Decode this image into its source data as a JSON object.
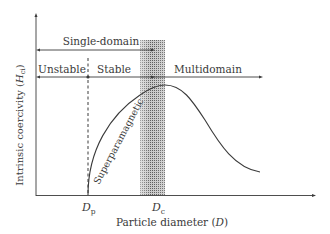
{
  "diagram": {
    "type": "coercivity-vs-particle-diameter",
    "y_axis_label": "Intrinsic coercivity (",
    "y_axis_symbol": "H",
    "y_axis_subscript": "ci",
    "y_axis_close": ")",
    "x_axis_label": "Particle diameter (",
    "x_axis_symbol": "D",
    "x_axis_close": ")",
    "tick_dp_main": "D",
    "tick_dp_sub": "p",
    "tick_dc_main": "D",
    "tick_dc_sub": "c",
    "region_single_domain": "Single-domain",
    "region_unstable": "Unstable",
    "region_stable": "Stable",
    "region_multidomain": "Multidomain",
    "curve_label": "Superparamagnetic",
    "colors": {
      "line": "#3a3a3a",
      "band": "#9a9a9a",
      "background": "#ffffff"
    }
  }
}
